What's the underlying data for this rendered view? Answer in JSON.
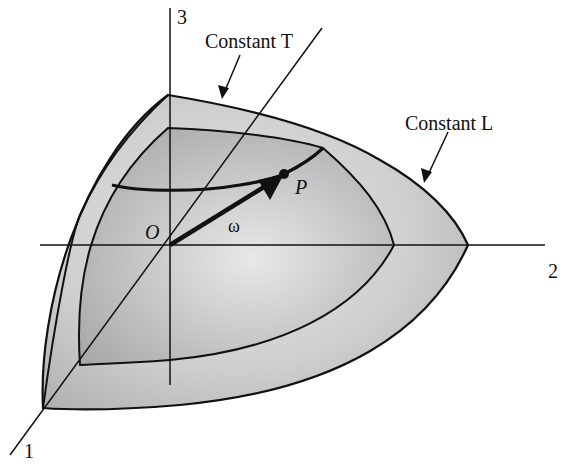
{
  "diagram": {
    "type": "3d-surface-diagram",
    "labels": {
      "axis_1": "1",
      "axis_2": "2",
      "axis_3": "3",
      "origin": "O",
      "point": "P",
      "vector": "ω",
      "constant_t": "Constant T",
      "constant_l": "Constant L"
    },
    "colors": {
      "line": "#111111",
      "outer_fill": "#c8c8c8",
      "inner_fill": "#b4b4b4",
      "background": "#ffffff"
    }
  }
}
